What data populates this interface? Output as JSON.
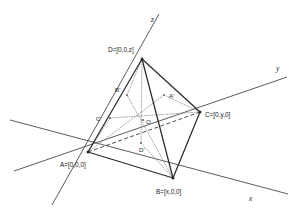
{
  "figure": {
    "type": "geometric-diagram",
    "width": 301,
    "height": 218,
    "colors": {
      "background": "#ffffff",
      "axis": "#4a4a4a",
      "edge_solid": "#2b2b2b",
      "edge_hidden": "#3a3a3a",
      "edge_construction": "#8a8a8a",
      "label": "#1c1c1c"
    },
    "axes": [
      {
        "id": "x",
        "label": "x",
        "label_x": 249,
        "label_y": 201,
        "x1": 10,
        "y1": 120,
        "x2": 288,
        "y2": 194
      },
      {
        "id": "y",
        "label": "y",
        "label_x": 276,
        "label_y": 71,
        "x1": 14,
        "y1": 171,
        "x2": 287,
        "y2": 77
      },
      {
        "id": "z",
        "label": "z",
        "label_x": 151,
        "label_y": 22,
        "x1": 52,
        "y1": 205,
        "x2": 159,
        "y2": 14
      }
    ],
    "vertices": [
      {
        "id": "A",
        "label": "A=[0,0,0]",
        "x": 88,
        "y": 152,
        "label_x": 60,
        "label_y": 167,
        "anchor": "start"
      },
      {
        "id": "B",
        "label": "B=[x,0,0]",
        "x": 173,
        "y": 178,
        "label_x": 156,
        "label_y": 194,
        "anchor": "start"
      },
      {
        "id": "C",
        "label": "C=[0,y,0]",
        "x": 200,
        "y": 112,
        "label_x": 205,
        "label_y": 117,
        "anchor": "start"
      },
      {
        "id": "D",
        "label": "D=[0,0,z]",
        "x": 142,
        "y": 59,
        "label_x": 108,
        "label_y": 52,
        "anchor": "start"
      }
    ],
    "interior_points": [
      {
        "id": "O",
        "label": "O",
        "x": 143,
        "y": 120,
        "label_x": 146,
        "label_y": 124,
        "anchor": "start"
      },
      {
        "id": "Aprime",
        "label": "A'",
        "x": 164,
        "y": 95,
        "label_x": 169,
        "label_y": 98,
        "anchor": "start"
      },
      {
        "id": "Bprime",
        "label": "B'",
        "x": 127,
        "y": 95,
        "label_x": 115,
        "label_y": 92,
        "anchor": "start"
      },
      {
        "id": "Cprime",
        "label": "C'",
        "x": 110,
        "y": 118,
        "label_x": 96,
        "label_y": 121,
        "anchor": "start"
      },
      {
        "id": "Dprime",
        "label": "D'",
        "x": 141,
        "y": 143,
        "label_x": 139,
        "label_y": 152,
        "anchor": "start"
      }
    ],
    "edges_solid": [
      {
        "from": "A",
        "to": "D",
        "x1": 88,
        "y1": 152,
        "x2": 142,
        "y2": 59
      },
      {
        "from": "A",
        "to": "B",
        "x1": 88,
        "y1": 152,
        "x2": 173,
        "y2": 178
      },
      {
        "from": "B",
        "to": "D",
        "x1": 173,
        "y1": 178,
        "x2": 142,
        "y2": 59
      },
      {
        "from": "B",
        "to": "C",
        "x1": 173,
        "y1": 178,
        "x2": 200,
        "y2": 112
      },
      {
        "from": "C",
        "to": "D",
        "x1": 200,
        "y1": 112,
        "x2": 142,
        "y2": 59
      }
    ],
    "edges_hidden": [
      {
        "from": "A",
        "to": "C",
        "x1": 88,
        "y1": 152,
        "x2": 200,
        "y2": 112
      }
    ],
    "construction_lines": [
      {
        "from": "A",
        "to": "Aprime",
        "x1": 88,
        "y1": 152,
        "x2": 164,
        "y2": 95
      },
      {
        "from": "Aprime",
        "to": "C",
        "x1": 164,
        "y1": 95,
        "x2": 200,
        "y2": 112
      },
      {
        "from": "B",
        "to": "Bprime",
        "x1": 173,
        "y1": 178,
        "x2": 127,
        "y2": 95
      },
      {
        "from": "Bprime",
        "to": "D",
        "x1": 127,
        "y1": 95,
        "x2": 142,
        "y2": 59
      },
      {
        "from": "C",
        "to": "Cprime",
        "x1": 200,
        "y1": 112,
        "x2": 110,
        "y2": 118
      },
      {
        "from": "Cprime",
        "to": "A",
        "x1": 110,
        "y1": 118,
        "x2": 88,
        "y2": 152
      },
      {
        "from": "D",
        "to": "Dprime",
        "x1": 142,
        "y1": 59,
        "x2": 141,
        "y2": 143
      },
      {
        "from": "Dprime",
        "to": "B",
        "x1": 141,
        "y1": 143,
        "x2": 173,
        "y2": 178
      }
    ]
  }
}
